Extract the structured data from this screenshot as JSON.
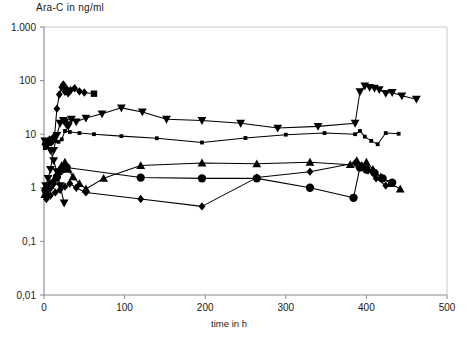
{
  "chart_data": {
    "type": "line",
    "title": "Ara-C in ng/ml",
    "xlabel": "time in h",
    "ylabel": "Ara-C in ng/ml",
    "yscale": "log",
    "xscale": "linear",
    "xlim": [
      0,
      500
    ],
    "ylim": [
      0.01,
      1000
    ],
    "grid": false,
    "legend": "none",
    "xticks": [
      0,
      100,
      200,
      300,
      400,
      500
    ],
    "xtick_labels": [
      "0",
      "100",
      "200",
      "300",
      "400",
      "500"
    ],
    "yticks": [
      0.01,
      0.1,
      1,
      10,
      100,
      1000
    ],
    "ytick_labels": [
      "0,01",
      "0,1",
      "1",
      "10",
      "100",
      "1.000"
    ],
    "decimal_separator": "comma",
    "series": [
      {
        "name": "patient-1-diamond-square",
        "marker": "diamond",
        "end_marker": "square",
        "x": [
          1,
          2,
          3,
          5,
          7,
          9,
          11,
          13,
          16,
          19,
          22,
          24,
          26,
          28,
          30,
          33,
          38,
          44,
          50,
          62
        ],
        "values": [
          6.5,
          7.0,
          6.2,
          7.5,
          8.0,
          7.0,
          8.5,
          9.0,
          30,
          55,
          75,
          85,
          62,
          70,
          58,
          66,
          72,
          63,
          60,
          57
        ]
      },
      {
        "name": "patient-2-down-triangle",
        "marker": "triangle-down",
        "x": [
          2,
          5,
          8,
          12,
          16,
          20,
          24,
          26,
          28,
          30,
          34,
          40,
          52,
          72,
          96,
          122,
          152,
          196,
          244,
          290,
          340,
          386,
          392,
          398,
          404,
          410,
          416,
          424,
          432,
          444,
          462
        ],
        "values": [
          1.1,
          1.5,
          2.2,
          5.0,
          9.5,
          16,
          18,
          17,
          15,
          14,
          19,
          17,
          20,
          24,
          31,
          26,
          19,
          18,
          16,
          13,
          14,
          16,
          62,
          80,
          75,
          72,
          68,
          58,
          60,
          52,
          45
        ]
      },
      {
        "name": "patient-3-small-square",
        "marker": "square-small",
        "x": [
          1,
          3,
          6,
          10,
          14,
          18,
          22,
          26,
          32,
          44,
          62,
          96,
          140,
          196,
          250,
          300,
          348,
          386,
          392,
          398,
          406,
          414,
          424,
          440
        ],
        "values": [
          5.5,
          6.0,
          6.5,
          7.0,
          7.5,
          7.2,
          8.0,
          11.5,
          11.0,
          10.5,
          10.0,
          9.2,
          8.4,
          7.0,
          8.5,
          9.8,
          10.5,
          10.0,
          11.5,
          9.0,
          7.5,
          6.5,
          10.5,
          10.2
        ]
      },
      {
        "name": "patient-4-up-triangle",
        "marker": "triangle-up",
        "x": [
          1,
          3,
          5,
          8,
          11,
          14,
          18,
          22,
          26,
          30,
          36,
          44,
          52,
          74,
          120,
          196,
          264,
          330,
          380,
          388,
          394,
          400,
          408,
          418,
          430,
          442
        ],
        "values": [
          0.75,
          0.85,
          1.0,
          1.1,
          1.3,
          1.5,
          2.0,
          2.6,
          3.0,
          2.2,
          1.6,
          1.2,
          0.95,
          1.5,
          2.6,
          2.9,
          2.8,
          3.0,
          2.7,
          3.2,
          2.5,
          3.0,
          2.2,
          1.6,
          1.2,
          0.95
        ]
      },
      {
        "name": "patient-5-circle",
        "marker": "circle",
        "x": [
          2,
          6,
          10,
          16,
          22,
          28,
          120,
          196,
          264,
          330,
          384,
          392,
          400,
          410,
          420,
          432
        ],
        "values": [
          0.9,
          1.0,
          1.2,
          1.6,
          2.2,
          2.4,
          1.55,
          1.5,
          1.5,
          1.0,
          0.65,
          2.4,
          2.2,
          1.9,
          1.5,
          1.25
        ]
      },
      {
        "name": "patient-6-diamond-low",
        "marker": "diamond",
        "x": [
          3,
          8,
          14,
          20,
          26,
          32,
          40,
          52,
          120,
          196,
          264,
          330,
          386,
          394,
          402,
          412,
          424
        ],
        "values": [
          0.62,
          0.72,
          0.82,
          0.92,
          1.05,
          1.2,
          1.0,
          0.82,
          0.62,
          0.45,
          1.55,
          2.0,
          2.9,
          2.6,
          2.1,
          1.5,
          1.1
        ]
      },
      {
        "name": "patient-7-down-arrow",
        "marker": "triangle-down",
        "x": [
          1,
          4,
          8,
          12,
          16,
          20,
          25
        ],
        "values": [
          7.5,
          6.5,
          5.0,
          3.2,
          2.0,
          1.1,
          0.52
        ]
      }
    ]
  }
}
